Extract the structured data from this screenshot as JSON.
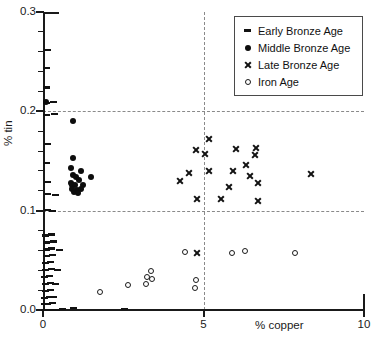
{
  "chart_data": {
    "type": "scatter",
    "title": "",
    "xlabel": "% copper",
    "ylabel": "% tin",
    "xlim": [
      0,
      10
    ],
    "ylim": [
      0.0,
      0.3
    ],
    "xticks": [
      "0",
      "5",
      "10"
    ],
    "xtick_values": [
      0,
      5,
      10
    ],
    "yticks": [
      "0.0",
      "0.1",
      "0.2",
      "0.3"
    ],
    "ytick_values": [
      0.0,
      0.1,
      0.2,
      0.3
    ],
    "grid": {
      "horizontal": [
        0.1,
        0.2
      ],
      "vertical": [
        5
      ],
      "style": "dashed",
      "color": "#8a8a8a"
    },
    "legend_position": "top-right",
    "series": [
      {
        "name": "Early Bronze Age",
        "marker": "dash",
        "color": "#121212",
        "points": [
          [
            0.05,
            0.0
          ],
          [
            0.1,
            0.0
          ],
          [
            0.18,
            0.0
          ],
          [
            0.28,
            0.0
          ],
          [
            0.42,
            0.0
          ],
          [
            0.6,
            0.001
          ],
          [
            0.95,
            0.002
          ],
          [
            2.55,
            0.001
          ],
          [
            0.05,
            0.006
          ],
          [
            0.14,
            0.006
          ],
          [
            0.3,
            0.007
          ],
          [
            0.06,
            0.012
          ],
          [
            0.2,
            0.013
          ],
          [
            0.34,
            0.013
          ],
          [
            0.08,
            0.019
          ],
          [
            0.24,
            0.02
          ],
          [
            0.07,
            0.026
          ],
          [
            0.22,
            0.027
          ],
          [
            0.4,
            0.026
          ],
          [
            0.06,
            0.033
          ],
          [
            0.19,
            0.034
          ],
          [
            0.09,
            0.04
          ],
          [
            0.26,
            0.041
          ],
          [
            0.45,
            0.04
          ],
          [
            0.08,
            0.047
          ],
          [
            0.23,
            0.048
          ],
          [
            0.11,
            0.054
          ],
          [
            0.31,
            0.055
          ],
          [
            0.1,
            0.061
          ],
          [
            0.28,
            0.062
          ],
          [
            0.5,
            0.06
          ],
          [
            0.12,
            0.068
          ],
          [
            0.33,
            0.069
          ],
          [
            0.09,
            0.075
          ],
          [
            0.27,
            0.076
          ],
          [
            0.13,
            0.101
          ],
          [
            0.3,
            0.1
          ],
          [
            0.15,
            0.117
          ],
          [
            0.38,
            0.116
          ],
          [
            0.14,
            0.129
          ],
          [
            0.12,
            0.148
          ],
          [
            0.13,
            0.167
          ],
          [
            0.11,
            0.196
          ],
          [
            0.36,
            0.197
          ],
          [
            0.1,
            0.208
          ],
          [
            0.34,
            0.209
          ],
          [
            0.12,
            0.224
          ],
          [
            0.11,
            0.244
          ],
          [
            0.13,
            0.262
          ]
        ]
      },
      {
        "name": "Middle Bronze Age",
        "marker": "filled-circle",
        "color": "#0d0d0d",
        "points": [
          [
            0.1,
            0.209
          ],
          [
            0.95,
            0.19
          ],
          [
            0.93,
            0.153
          ],
          [
            0.88,
            0.143
          ],
          [
            1.17,
            0.14
          ],
          [
            0.92,
            0.136
          ],
          [
            1.03,
            0.134
          ],
          [
            1.48,
            0.134
          ],
          [
            1.12,
            0.131
          ],
          [
            0.86,
            0.128
          ],
          [
            0.9,
            0.126
          ],
          [
            1.0,
            0.126
          ],
          [
            1.25,
            0.126
          ],
          [
            0.89,
            0.122
          ],
          [
            1.05,
            0.121
          ],
          [
            1.18,
            0.122
          ],
          [
            0.96,
            0.119
          ],
          [
            1.1,
            0.118
          ]
        ]
      },
      {
        "name": "Late Bronze Age",
        "marker": "cross",
        "color": "#121212",
        "points": [
          [
            5.17,
            0.172
          ],
          [
            4.77,
            0.161
          ],
          [
            6.62,
            0.163
          ],
          [
            6.02,
            0.162
          ],
          [
            5.05,
            0.157
          ],
          [
            6.6,
            0.156
          ],
          [
            6.33,
            0.146
          ],
          [
            5.18,
            0.14
          ],
          [
            5.93,
            0.14
          ],
          [
            4.53,
            0.138
          ],
          [
            6.45,
            0.135
          ],
          [
            8.35,
            0.137
          ],
          [
            4.28,
            0.13
          ],
          [
            6.68,
            0.128
          ],
          [
            5.8,
            0.124
          ],
          [
            4.8,
            0.112
          ],
          [
            5.55,
            0.112
          ],
          [
            6.7,
            0.11
          ],
          [
            4.8,
            0.057
          ]
        ]
      },
      {
        "name": "Iron Age",
        "marker": "open-circle",
        "color": "#1a1a1a",
        "points": [
          [
            4.42,
            0.058
          ],
          [
            5.9,
            0.057
          ],
          [
            6.3,
            0.059
          ],
          [
            7.85,
            0.057
          ],
          [
            4.78,
            0.03
          ],
          [
            4.73,
            0.022
          ],
          [
            3.37,
            0.039
          ],
          [
            3.25,
            0.033
          ],
          [
            3.4,
            0.031
          ],
          [
            3.2,
            0.026
          ],
          [
            2.65,
            0.025
          ],
          [
            1.78,
            0.018
          ]
        ]
      }
    ]
  },
  "legend": {
    "items": [
      {
        "label": "Early Bronze Age",
        "marker": "dash"
      },
      {
        "label": "Middle Bronze Age",
        "marker": "filled-circle"
      },
      {
        "label": "Late Bronze Age",
        "marker": "cross"
      },
      {
        "label": "Iron Age",
        "marker": "open-circle"
      }
    ]
  },
  "colors": {
    "axis": "#1a1a1a",
    "grid": "#8a8a8a",
    "marker": "#121212",
    "background": "#ffffff"
  }
}
